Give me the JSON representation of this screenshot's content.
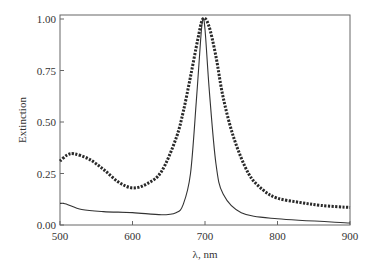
{
  "chart_data": {
    "type": "line",
    "title": "",
    "xlabel": "λ, nm",
    "ylabel": "Extinction",
    "xlim": [
      500,
      900
    ],
    "ylim": [
      0,
      1.0
    ],
    "grid": false,
    "legend": null,
    "x_ticks": [
      "500",
      "600",
      "700",
      "800",
      "900"
    ],
    "y_ticks": [
      "0.00",
      "0.25",
      "0.50",
      "0.75",
      "1.00"
    ],
    "series": [
      {
        "name": "broad (dotted/thick)",
        "style": "thick-dotted",
        "x": [
          500,
          510,
          520,
          540,
          560,
          580,
          600,
          620,
          640,
          660,
          670,
          680,
          690,
          697,
          705,
          715,
          725,
          740,
          760,
          780,
          800,
          830,
          860,
          900
        ],
        "values": [
          0.31,
          0.34,
          0.345,
          0.32,
          0.27,
          0.21,
          0.18,
          0.2,
          0.26,
          0.42,
          0.55,
          0.72,
          0.9,
          1.0,
          0.97,
          0.82,
          0.62,
          0.42,
          0.25,
          0.17,
          0.13,
          0.11,
          0.095,
          0.085
        ]
      },
      {
        "name": "narrow (thin)",
        "style": "thin-solid",
        "x": [
          500,
          505,
          510,
          530,
          560,
          600,
          640,
          660,
          670,
          680,
          688,
          694,
          697,
          700,
          706,
          715,
          725,
          750,
          800,
          900
        ],
        "values": [
          0.105,
          0.105,
          0.1,
          0.075,
          0.065,
          0.06,
          0.05,
          0.06,
          0.1,
          0.25,
          0.6,
          0.9,
          1.0,
          0.95,
          0.65,
          0.3,
          0.15,
          0.06,
          0.03,
          0.01
        ]
      }
    ]
  }
}
